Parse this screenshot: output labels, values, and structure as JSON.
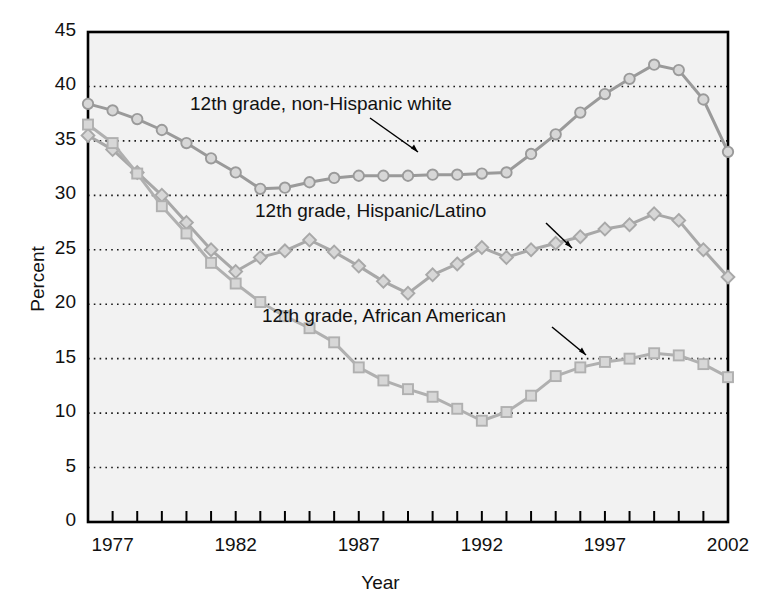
{
  "chart_data": {
    "type": "line",
    "title": "",
    "xlabel": "Year",
    "ylabel": "Percent",
    "xlim": [
      1976,
      2002
    ],
    "ylim": [
      0,
      45
    ],
    "yticks": [
      0,
      5,
      10,
      15,
      20,
      25,
      30,
      35,
      40,
      45
    ],
    "xticks": [
      1977,
      1982,
      1987,
      1992,
      1997,
      2002
    ],
    "grid": "horizontal-dotted",
    "legend_position": "inline-annotations",
    "series": [
      {
        "name": "12th grade, non-Hispanic white",
        "marker": "circle",
        "color": "#9a9a9a",
        "x": [
          1976,
          1977,
          1978,
          1979,
          1980,
          1981,
          1982,
          1983,
          1984,
          1985,
          1986,
          1987,
          1988,
          1989,
          1990,
          1991,
          1992,
          1993,
          1994,
          1995,
          1996,
          1997,
          1998,
          1999,
          2000,
          2001,
          2002
        ],
        "values": [
          38.4,
          37.8,
          37.0,
          36.0,
          34.8,
          33.4,
          32.1,
          30.6,
          30.7,
          31.2,
          31.6,
          31.8,
          31.8,
          31.8,
          31.9,
          31.9,
          32.0,
          32.1,
          33.8,
          35.6,
          37.6,
          39.3,
          40.7,
          42.0,
          41.5,
          38.8,
          34.0
        ]
      },
      {
        "name": "12th grade, Hispanic/Latino",
        "marker": "diamond",
        "color": "#a8a8a8",
        "x": [
          1976,
          1977,
          1978,
          1979,
          1980,
          1981,
          1982,
          1983,
          1984,
          1985,
          1986,
          1987,
          1988,
          1989,
          1990,
          1991,
          1992,
          1993,
          1994,
          1995,
          1996,
          1997,
          1998,
          1999,
          2000,
          2001,
          2002
        ],
        "values": [
          35.5,
          34.2,
          32.1,
          30.0,
          27.5,
          25.0,
          23.0,
          24.3,
          24.9,
          25.9,
          24.8,
          23.5,
          22.1,
          21.0,
          22.7,
          23.7,
          25.2,
          24.3,
          25.0,
          25.6,
          26.2,
          26.9,
          27.3,
          28.3,
          27.7,
          25.0,
          22.5
        ]
      },
      {
        "name": "12th grade, African American",
        "marker": "square",
        "color": "#b0b0b0",
        "x": [
          1976,
          1977,
          1978,
          1979,
          1980,
          1981,
          1982,
          1983,
          1984,
          1985,
          1986,
          1987,
          1988,
          1989,
          1990,
          1991,
          1992,
          1993,
          1994,
          1995,
          1996,
          1997,
          1998,
          1999,
          2000,
          2001,
          2002
        ],
        "values": [
          36.5,
          34.8,
          32.0,
          29.0,
          26.5,
          23.8,
          21.9,
          20.2,
          18.9,
          17.8,
          16.5,
          14.2,
          13.0,
          12.2,
          11.5,
          10.4,
          9.3,
          10.1,
          11.6,
          13.4,
          14.2,
          14.7,
          15.0,
          15.5,
          15.3,
          14.5,
          13.3
        ]
      }
    ],
    "annotations": [
      {
        "text": "12th grade, non-Hispanic white",
        "series": "white"
      },
      {
        "text": "12th grade, Hispanic/Latino",
        "series": "hispanic"
      },
      {
        "text": "12th grade, African American",
        "series": "african-american"
      }
    ]
  }
}
